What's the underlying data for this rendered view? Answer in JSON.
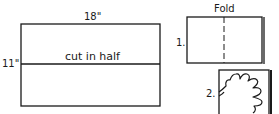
{
  "diagram": {
    "paper": {
      "width_label": "18\"",
      "height_label": "11\"",
      "cut_label": "cut in half"
    },
    "step1": {
      "title": "Fold",
      "number": "1."
    },
    "step2": {
      "number": "2.",
      "icon": "hand-outline-icon"
    },
    "colors": {
      "stroke": "#1a1a1a",
      "background": "#ffffff"
    }
  }
}
